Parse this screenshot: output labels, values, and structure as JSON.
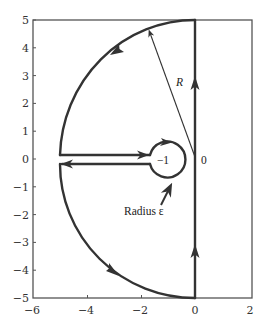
{
  "diagram": {
    "x_axis": {
      "range": [
        -6,
        2
      ],
      "ticks": [
        {
          "value": -6,
          "label": "−6"
        },
        {
          "value": -4,
          "label": "−4"
        },
        {
          "value": -2,
          "label": "−2"
        },
        {
          "value": 0,
          "label": "0"
        },
        {
          "value": 2,
          "label": "2"
        }
      ]
    },
    "y_axis": {
      "range": [
        -5,
        5
      ],
      "ticks": [
        {
          "value": 5,
          "label": "5"
        },
        {
          "value": 4,
          "label": "4"
        },
        {
          "value": 3,
          "label": "3"
        },
        {
          "value": 2,
          "label": "2"
        },
        {
          "value": 1,
          "label": "1"
        },
        {
          "value": 0,
          "label": "0"
        },
        {
          "value": -1,
          "label": "−1"
        },
        {
          "value": -2,
          "label": "−2"
        },
        {
          "value": -3,
          "label": "−3"
        },
        {
          "value": -4,
          "label": "−4"
        },
        {
          "value": -5,
          "label": "−5"
        }
      ]
    },
    "annotations": {
      "radius_R_label": "R",
      "point_minus_one_label": "−1",
      "origin_label": "0",
      "radius_epsilon_label": "Radius ε"
    },
    "contour": {
      "large_arc_radius": "R",
      "small_circle_center": -1,
      "small_circle_radius": "ε",
      "line_color": "#333333"
    }
  }
}
